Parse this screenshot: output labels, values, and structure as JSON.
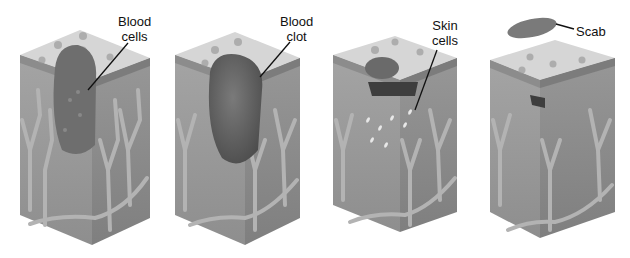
{
  "diagram": {
    "stages": [
      {
        "id": "stage-1",
        "label_lines": [
          "Blood",
          "cells"
        ]
      },
      {
        "id": "stage-2",
        "label_lines": [
          "Blood",
          "clot"
        ]
      },
      {
        "id": "stage-3",
        "label_lines": [
          "Skin",
          "cells"
        ]
      },
      {
        "id": "stage-4",
        "label_lines": [
          "Scab"
        ]
      }
    ],
    "colors": {
      "top": "#d4d4d4",
      "front": "#9a9a9a",
      "side": "#8a8a8a",
      "vessel": "#b0b0b0",
      "clot": "#5e5e5e",
      "scab": "#7a7a7a"
    }
  }
}
